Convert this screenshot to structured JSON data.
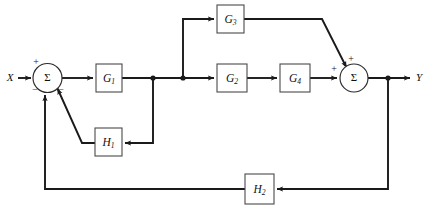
{
  "diagram": {
    "type": "signal-flow-block-diagram",
    "background_color": "#ffffff",
    "line_color": "#1a1a1a",
    "block_fill": "#ffffff",
    "block_stroke": "#4a4a4a",
    "io": {
      "input_label": "X",
      "output_label": "Y"
    },
    "blocks": [
      {
        "id": "G1",
        "label": "G",
        "subscript": "1",
        "x": 96,
        "y": 64,
        "w": 26,
        "h": 28
      },
      {
        "id": "G2",
        "label": "G",
        "subscript": "2",
        "x": 217,
        "y": 64,
        "w": 30,
        "h": 28
      },
      {
        "id": "G3",
        "label": "G",
        "subscript": "3",
        "x": 217,
        "y": 5,
        "w": 27,
        "h": 28
      },
      {
        "id": "G4",
        "label": "G",
        "subscript": "4",
        "x": 280,
        "y": 64,
        "w": 30,
        "h": 28
      },
      {
        "id": "H1",
        "label": "H",
        "subscript": "1",
        "x": 95,
        "y": 128,
        "w": 27,
        "h": 28
      },
      {
        "id": "H2",
        "label": "H",
        "subscript": "2",
        "x": 245,
        "y": 174,
        "w": 29,
        "h": 30
      }
    ],
    "summers": [
      {
        "id": "sum-left",
        "symbol": "Σ",
        "cx": 47.5,
        "cy": 78,
        "r": 14.5,
        "signs": [
          {
            "text": "+",
            "x": 36,
            "y": 63
          },
          {
            "text": "−",
            "x": 35,
            "y": 91
          },
          {
            "text": "−",
            "x": 61,
            "y": 91
          }
        ]
      },
      {
        "id": "sum-right",
        "symbol": "Σ",
        "cx": 354,
        "cy": 78,
        "r": 14,
        "signs": [
          {
            "text": "+",
            "x": 351,
            "y": 60
          },
          {
            "text": "+",
            "x": 334,
            "y": 70
          }
        ]
      }
    ],
    "nodes": [
      {
        "id": "node-g1-out-h1",
        "cx": 153,
        "cy": 78
      },
      {
        "id": "node-branch-g3",
        "cx": 183,
        "cy": 78
      },
      {
        "id": "node-output-fb",
        "cx": 388,
        "cy": 78
      }
    ],
    "signal_names": {
      "forward_path_1": "G1",
      "parallel_upper": "G3",
      "parallel_lower": "G2 G4",
      "inner_feedback": "H1",
      "outer_feedback": "H2"
    }
  }
}
